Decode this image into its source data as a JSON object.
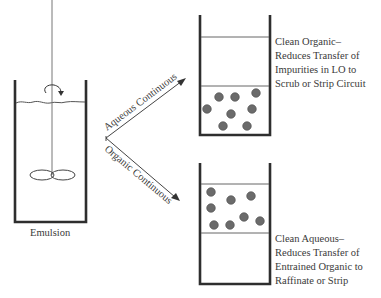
{
  "diagram": {
    "type": "process-schematic",
    "colors": {
      "wall": "#2e2e2e",
      "line": "#555555",
      "droplet_fill": "#6b6b6b",
      "droplet_stroke": "#4a4a4a",
      "text": "#3a3a3a"
    },
    "mixer": {
      "label": "Emulsion",
      "components": [
        "beaker",
        "agitator-shaft",
        "impeller",
        "rotation-arrow",
        "liquid-surface"
      ]
    },
    "paths": [
      {
        "id": "aqueous",
        "label": "Aqueous Continuous"
      },
      {
        "id": "organic",
        "label": "Organic Continuous"
      }
    ],
    "outcomes": [
      {
        "id": "aqueous-continuous-result",
        "title": "Clean Organic–",
        "lines": [
          "Clean Organic–",
          "Reduces Transfer of",
          "Impurities in LO to",
          "Scrub or Strip Circuit"
        ],
        "droplets_in": "lower phase"
      },
      {
        "id": "organic-continuous-result",
        "title": "Clean Aqueous–",
        "lines": [
          "Clean Aqueous–",
          "Reduces Transfer of",
          "Entrained Organic to",
          "Raffinate or Strip"
        ],
        "droplets_in": "upper phase"
      }
    ]
  }
}
